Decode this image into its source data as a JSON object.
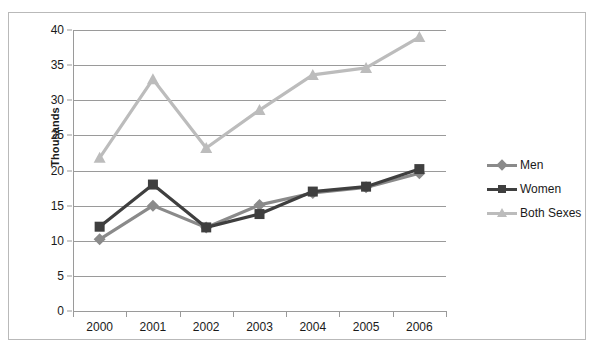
{
  "chart_data": {
    "type": "line",
    "title": "",
    "xlabel": "",
    "ylabel": "Thousands",
    "categories": [
      "2000",
      "2001",
      "2002",
      "2003",
      "2004",
      "2005",
      "2006"
    ],
    "ylim": [
      0,
      40
    ],
    "ytick_step": 5,
    "yticks": [
      "0",
      "5",
      "10",
      "15",
      "20",
      "25",
      "30",
      "35",
      "40"
    ],
    "grid": true,
    "legend_position": "right",
    "series": [
      {
        "name": "Men",
        "color": "#8a8a8a",
        "marker": "diamond",
        "values": [
          10.2,
          15.0,
          11.9,
          15.1,
          16.8,
          17.6,
          19.6
        ]
      },
      {
        "name": "Women",
        "color": "#3f3f3f",
        "marker": "square",
        "values": [
          12.0,
          18.0,
          11.9,
          13.8,
          17.0,
          17.7,
          20.2
        ]
      },
      {
        "name": "Both Sexes",
        "color": "#bcbcbc",
        "marker": "triangle",
        "values": [
          21.8,
          33.0,
          23.2,
          28.6,
          33.6,
          34.6,
          39.0
        ]
      }
    ]
  }
}
